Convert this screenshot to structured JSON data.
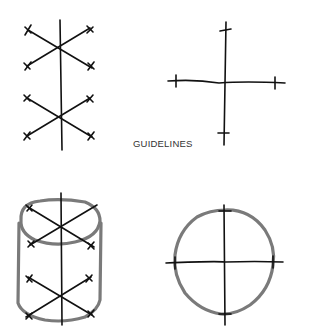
{
  "caption": "GUIDELINES",
  "figures": [
    {
      "id": "axes-vertical-with-diagonals",
      "description": "vertical axis with two pairs of crossing diagonals, tick-marked ends"
    },
    {
      "id": "axes-cross",
      "description": "horizontal and vertical axes with tick marks"
    },
    {
      "id": "cylinder-on-guidelines",
      "description": "cylinder drawn over vertical axis and diagonals"
    },
    {
      "id": "circle-on-guidelines",
      "description": "circle drawn over crossing axes"
    }
  ],
  "colors": {
    "ink": "#111111",
    "shape": "#7a7a7a",
    "background": "#ffffff"
  }
}
